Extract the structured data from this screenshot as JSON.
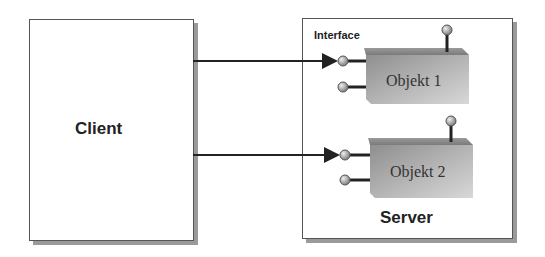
{
  "client": {
    "label": "Client"
  },
  "server": {
    "label": "Server",
    "interface_label": "Interface"
  },
  "objects": [
    {
      "label": "Objekt 1"
    },
    {
      "label": "Objekt 2"
    }
  ],
  "colors": {
    "box_border": "#555555",
    "shadow": "#9a9a9a",
    "object_fill": "#b8b8b8",
    "pin_fill": "#c8c8c8",
    "line": "#222222"
  }
}
